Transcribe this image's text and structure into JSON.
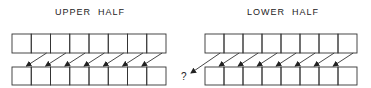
{
  "panels": [
    {
      "title": "UPPER  HALF",
      "box_count_top": 8,
      "box_count_bottom": 8,
      "arrows": 7,
      "question_mark": false
    },
    {
      "title": "LOWER  HALF",
      "box_count_top": 8,
      "box_count_bottom": 8,
      "arrows": 8,
      "question_mark": true
    }
  ],
  "question_mark_text": "?",
  "colors": {
    "stroke": "#333333",
    "background": "#ffffff"
  }
}
